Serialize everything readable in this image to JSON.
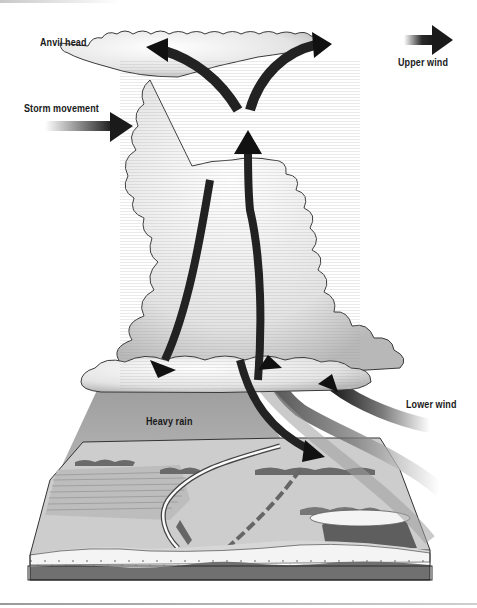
{
  "diagram": {
    "labels": {
      "anvil_head": "Anvil head",
      "upper_wind": "Upper wind",
      "storm_movement": "Storm movement",
      "lower_wind": "Lower wind",
      "heavy_rain": "Heavy rain"
    },
    "elements": [
      {
        "name": "anvil-cloud",
        "description": "Wide flat-topped cloud top spreading horizontally"
      },
      {
        "name": "cumulonimbus-column",
        "description": "Tall billowing cloud tower"
      },
      {
        "name": "updraft-arrow",
        "description": "Dark arrow rising up through the center of the cloud"
      },
      {
        "name": "downdraft-arrow",
        "description": "Dark arrow descending on left side of cloud"
      },
      {
        "name": "outflow-arrows",
        "description": "Arrows curving out at top of anvil to left and right"
      },
      {
        "name": "inflow-arrows",
        "description": "Grey curved arrows entering cloud base from lower right"
      },
      {
        "name": "rain-shaft",
        "description": "Grey shaded area of heavy rain below cloud base"
      },
      {
        "name": "landscape-block",
        "description": "3D cutaway block of terrain with fields, road, trees, lake and soil layers"
      }
    ],
    "colors": {
      "arrow_dark": "#1e1e1e",
      "arrow_grey": "#8a8a8a",
      "cloud_fill": "#eeeeee",
      "cloud_outline": "#3a3a3a",
      "rain": "#a8a8a8",
      "land": "#c9c9c9",
      "soil_light": "#f3f3f3",
      "soil_dark": "#6e6e6e"
    }
  }
}
